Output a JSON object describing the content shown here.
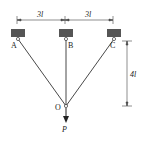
{
  "diagram": {
    "type": "three-bar truss / hanging cables",
    "dimensions": {
      "left_span": "3l",
      "right_span": "3l",
      "height": "4l"
    },
    "labels": {
      "A": "A",
      "B": "B",
      "C": "C",
      "O": "O",
      "P": "P"
    },
    "colors": {
      "line": "#333333",
      "support": "#555555"
    }
  }
}
